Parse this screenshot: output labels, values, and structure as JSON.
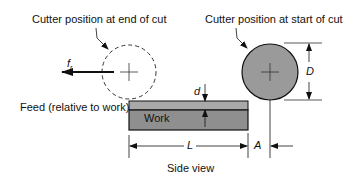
{
  "labels": {
    "end_cut": "Cutter position at end of cut",
    "start_cut": "Cutter position at start of cut",
    "feed_symbol": "f",
    "feed_subscript": "r",
    "feed_relative": "Feed (relative to work)",
    "work": "Work",
    "depth": "d",
    "diameter": "D",
    "length": "L",
    "approach": "A",
    "caption": "Side view"
  },
  "colors": {
    "work_top": "#a9a9a9",
    "work_body": "#8f8f8f",
    "cutter_fill": "#9a9a9a",
    "stroke": "#111111"
  }
}
